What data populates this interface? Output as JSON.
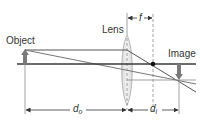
{
  "diagram": {
    "labels": {
      "object": "Object",
      "lens": "Lens",
      "image": "Image",
      "focal_length": "f",
      "object_distance_main": "d",
      "object_distance_sub": "o",
      "image_distance_main": "d",
      "image_distance_sub": "i"
    },
    "colors": {
      "axis": "#3a3a3a",
      "ray": "#555555",
      "object_arrow": "#7a7a7a",
      "lens_fill": "#e6e6e6",
      "focal_point": "#111111",
      "guide": "#9a9a9a"
    }
  }
}
